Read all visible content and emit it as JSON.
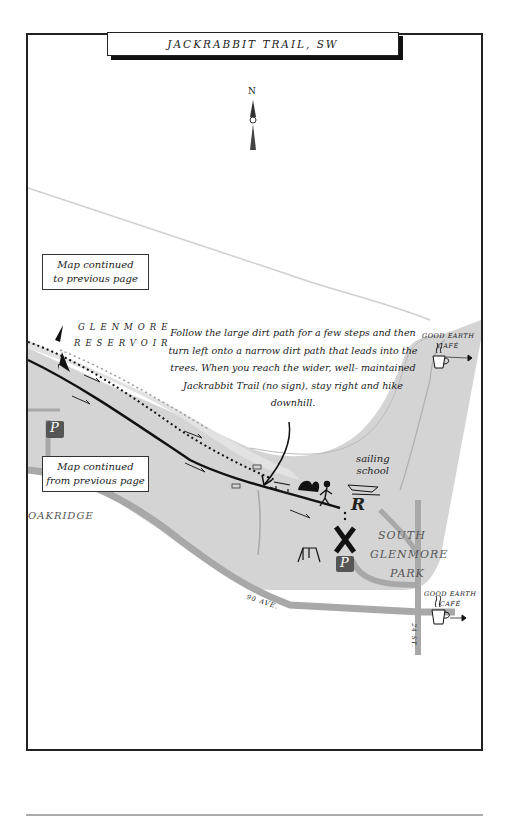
{
  "header": {
    "title": "JACKRABBIT TRAIL, SW"
  },
  "compass": {
    "north_label": "N"
  },
  "map_labels": {
    "reservoir_line1": "GLENMORE",
    "reservoir_line2": "RESERVOIR",
    "neighborhood": "OAKRIDGE",
    "park_line1": "SOUTH",
    "park_line2": "GLENMORE",
    "park_line3": "PARK",
    "sailing_line1": "sailing",
    "sailing_line2": "school",
    "avenue": "90 AVE.",
    "street": "24 ST."
  },
  "cafes": [
    {
      "line1": "GOOD EARTH",
      "line2": "CAFÉ"
    },
    {
      "line1": "GOOD EARTH",
      "line2": "CAFÉ"
    }
  ],
  "continuation": {
    "to_previous": {
      "line1": "Map continued",
      "line2": "to previous page"
    },
    "from_previous": {
      "line1": "Map continued",
      "line2": "from previous page"
    }
  },
  "instructions": "Follow the large dirt path for a few steps and then turn left onto a narrow dirt path that leads into the trees. When you reach the wider, well- maintained Jackrabbit Trail (no sign), stay right and hike downhill.",
  "symbols": {
    "parking": "P",
    "restroom": "R",
    "trailhead": "X"
  },
  "colors": {
    "park_fill": "#d4d4d4",
    "road": "#a8a8a8",
    "trail": "#111111",
    "frame": "#222222"
  }
}
